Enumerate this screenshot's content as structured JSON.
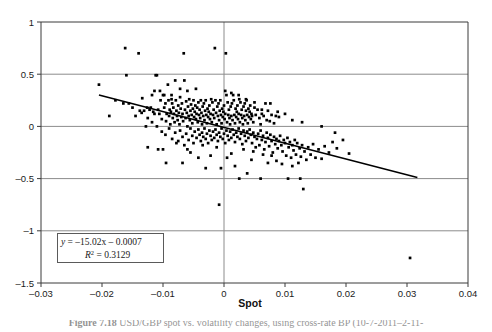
{
  "figure": {
    "name": "scatter-plot-spot-regression",
    "background": "#ffffff",
    "frame_color": "#3a3a3a",
    "grid_color": "#8c8c8c",
    "point_color": "#000000",
    "line_color": "#000000"
  },
  "axis": {
    "x_title": "Spot",
    "y_title": "",
    "x_ticks": [
      "-0.03",
      "-0.02",
      "-0.01",
      "0",
      "0.01",
      "0.02",
      "0.03",
      "0.04"
    ],
    "x_tick_values": [
      -0.03,
      -0.02,
      -0.01,
      0,
      0.01,
      0.02,
      0.03,
      0.04
    ],
    "y_ticks": [
      "1",
      "0.5",
      "0",
      "-0.5",
      "-1",
      "-1.5"
    ],
    "y_tick_values": [
      1,
      0.5,
      0,
      -0.5,
      -1,
      -1.5
    ]
  },
  "annotation": {
    "name": "regression-equation-box",
    "equation_lhs": "y",
    "equation_rhs": " = –15.02x – 0.0007",
    "equation_full": "y = –15.02x – 0.0007",
    "r2_symbol": "R",
    "r2_sup": "2",
    "r2_value": " = 0.3129",
    "r2_full": "R2 = 0.3129"
  },
  "caption": {
    "label": "Figure 7.18",
    "text": "USD/GBP spot vs. volatility changes, using cross-rate BP (10-7-2011–2-11-"
  },
  "chart_data": {
    "type": "scatter",
    "title": "",
    "xlabel": "Spot",
    "ylabel": "",
    "xlim": [
      -0.03,
      0.04
    ],
    "ylim": [
      -1.5,
      1.0
    ],
    "grid": true,
    "legend": false,
    "trendline": {
      "type": "linear",
      "slope": -15.02,
      "intercept": -0.0007,
      "r_squared": 0.3129,
      "x_start": -0.0205,
      "x_end": 0.0317,
      "y_start": 0.3,
      "y_end": -0.49
    },
    "points": [
      [
        -0.0205,
        0.4
      ],
      [
        -0.0188,
        0.1
      ],
      [
        -0.0178,
        0.25
      ],
      [
        -0.0162,
        0.75
      ],
      [
        -0.016,
        0.49
      ],
      [
        -0.0156,
        0.22
      ],
      [
        -0.014,
        0.7
      ],
      [
        -0.0138,
        0.15
      ],
      [
        -0.0131,
        0.15
      ],
      [
        -0.0128,
        0.0
      ],
      [
        -0.0126,
        0.18
      ],
      [
        -0.0122,
        0.16
      ],
      [
        -0.012,
        0.18
      ],
      [
        -0.0118,
        0.3
      ],
      [
        -0.0116,
        0.14
      ],
      [
        -0.0114,
        0.12
      ],
      [
        -0.0112,
        0.49
      ],
      [
        -0.011,
        0.49
      ],
      [
        -0.0108,
        0.16
      ],
      [
        -0.0106,
        0.12
      ],
      [
        -0.0105,
        0.34
      ],
      [
        -0.0104,
        0.25
      ],
      [
        -0.0102,
        0.07
      ],
      [
        -0.01,
        0.3
      ],
      [
        -0.0098,
        0.18
      ],
      [
        -0.0096,
        0.22
      ],
      [
        -0.0095,
        0.05
      ],
      [
        -0.0094,
        0.12
      ],
      [
        -0.0092,
        0.4
      ],
      [
        -0.0091,
        0.25
      ],
      [
        -0.009,
        0.1
      ],
      [
        -0.0089,
        0.16
      ],
      [
        -0.0088,
        0.02
      ],
      [
        -0.0087,
        0.14
      ],
      [
        -0.0086,
        0.3
      ],
      [
        -0.0085,
        0.22
      ],
      [
        -0.0084,
        0.08
      ],
      [
        -0.0083,
        0.18
      ],
      [
        -0.0082,
        0.12
      ],
      [
        -0.0081,
        0.04
      ],
      [
        -0.008,
        0.44
      ],
      [
        -0.0079,
        0.25
      ],
      [
        -0.0078,
        0.15
      ],
      [
        -0.0077,
        0.1
      ],
      [
        -0.0076,
        0.06
      ],
      [
        -0.0075,
        0.2
      ],
      [
        -0.0074,
        0.13
      ],
      [
        -0.0073,
        0.02
      ],
      [
        -0.0072,
        0.28
      ],
      [
        -0.0071,
        0.17
      ],
      [
        -0.007,
        0.09
      ],
      [
        -0.0069,
        0.22
      ],
      [
        -0.0068,
        0.12
      ],
      [
        -0.0067,
        0.05
      ],
      [
        -0.0066,
        0.7
      ],
      [
        -0.0065,
        0.44
      ],
      [
        -0.0064,
        0.16
      ],
      [
        -0.0063,
        0.08
      ],
      [
        -0.0062,
        0.24
      ],
      [
        -0.0061,
        0.13
      ],
      [
        -0.006,
        0.0
      ],
      [
        -0.0059,
        0.19
      ],
      [
        -0.0058,
        0.1
      ],
      [
        -0.0057,
        0.26
      ],
      [
        -0.0056,
        0.06
      ],
      [
        -0.0055,
        0.15
      ],
      [
        -0.0054,
        0.21
      ],
      [
        -0.0053,
        0.11
      ],
      [
        -0.0052,
        0.03
      ],
      [
        -0.0051,
        0.17
      ],
      [
        -0.005,
        0.25
      ],
      [
        -0.0049,
        0.09
      ],
      [
        -0.0048,
        0.14
      ],
      [
        -0.0047,
        0.2
      ],
      [
        -0.0046,
        0.07
      ],
      [
        -0.0045,
        0.12
      ],
      [
        -0.0044,
        0.18
      ],
      [
        -0.0043,
        0.04
      ],
      [
        -0.0042,
        0.23
      ],
      [
        -0.0041,
        0.11
      ],
      [
        -0.004,
        0.16
      ],
      [
        -0.0039,
        0.08
      ],
      [
        -0.0038,
        0.25
      ],
      [
        -0.0037,
        0.13
      ],
      [
        -0.0036,
        0.02
      ],
      [
        -0.0035,
        0.19
      ],
      [
        -0.0034,
        0.1
      ],
      [
        -0.0033,
        0.22
      ],
      [
        -0.0032,
        0.06
      ],
      [
        -0.0031,
        0.15
      ],
      [
        -0.003,
        0.25
      ],
      [
        -0.0029,
        0.11
      ],
      [
        -0.0028,
        0.03
      ],
      [
        -0.0027,
        0.17
      ],
      [
        -0.0026,
        0.09
      ],
      [
        -0.0025,
        0.14
      ],
      [
        -0.0024,
        0.2
      ],
      [
        -0.0023,
        0.07
      ],
      [
        -0.0022,
        0.12
      ],
      [
        -0.0021,
        0.26
      ],
      [
        -0.002,
        0.04
      ],
      [
        -0.0019,
        0.23
      ],
      [
        -0.0018,
        0.11
      ],
      [
        -0.0017,
        0.16
      ],
      [
        -0.0016,
        0.08
      ],
      [
        -0.0015,
        0.75
      ],
      [
        -0.0014,
        0.25
      ],
      [
        -0.0013,
        0.13
      ],
      [
        -0.0012,
        0.02
      ],
      [
        -0.0011,
        0.19
      ],
      [
        -0.001,
        0.1
      ],
      [
        -0.0009,
        0.22
      ],
      [
        -0.0008,
        -0.75
      ],
      [
        -0.0008,
        0.06
      ],
      [
        -0.0007,
        0.15
      ],
      [
        -0.0006,
        0.25
      ],
      [
        -0.0005,
        0.11
      ],
      [
        -0.0004,
        0.03
      ],
      [
        -0.0003,
        0.17
      ],
      [
        -0.0002,
        0.09
      ],
      [
        -0.0001,
        0.14
      ],
      [
        0.0,
        0.2
      ],
      [
        0.0001,
        0.07
      ],
      [
        0.0002,
        0.12
      ],
      [
        0.0003,
        0.7
      ],
      [
        0.0004,
        0.3
      ],
      [
        0.0005,
        0.04
      ],
      [
        0.0006,
        0.23
      ],
      [
        0.0007,
        0.11
      ],
      [
        0.0008,
        0.16
      ],
      [
        0.0009,
        0.08
      ],
      [
        0.001,
        0.02
      ],
      [
        0.0011,
        0.19
      ],
      [
        0.0012,
        0.1
      ],
      [
        0.0013,
        0.22
      ],
      [
        0.0014,
        0.06
      ],
      [
        0.0015,
        0.3
      ],
      [
        0.0016,
        0.25
      ],
      [
        0.0017,
        0.11
      ],
      [
        0.0018,
        0.03
      ],
      [
        0.0019,
        0.17
      ],
      [
        0.002,
        0.09
      ],
      [
        0.0021,
        0.14
      ],
      [
        0.0022,
        0.2
      ],
      [
        0.0023,
        0.07
      ],
      [
        0.0024,
        0.12
      ],
      [
        0.0025,
        0.26
      ],
      [
        0.0026,
        0.04
      ],
      [
        0.0027,
        0.23
      ],
      [
        0.0028,
        0.11
      ],
      [
        0.0029,
        0.16
      ],
      [
        0.003,
        0.08
      ],
      [
        0.0031,
        0.02
      ],
      [
        0.0032,
        0.19
      ],
      [
        0.0033,
        0.1
      ],
      [
        0.0034,
        0.22
      ],
      [
        0.0035,
        0.06
      ],
      [
        0.0036,
        0.15
      ],
      [
        0.0037,
        0.25
      ],
      [
        0.0038,
        0.11
      ],
      [
        0.0039,
        0.03
      ],
      [
        0.004,
        0.17
      ],
      [
        0.0041,
        0.09
      ],
      [
        0.0042,
        0.14
      ],
      [
        0.0043,
        0.2
      ],
      [
        0.0044,
        0.07
      ],
      [
        0.0045,
        0.12
      ],
      [
        0.0046,
        0.1
      ],
      [
        0.0048,
        0.04
      ],
      [
        0.005,
        0.23
      ],
      [
        0.0052,
        0.11
      ],
      [
        0.0055,
        0.16
      ],
      [
        0.0058,
        0.08
      ],
      [
        0.006,
        0.02
      ],
      [
        0.0062,
        0.12
      ],
      [
        0.0065,
        0.1
      ],
      [
        0.0068,
        0.22
      ],
      [
        0.007,
        0.06
      ],
      [
        0.0072,
        0.15
      ],
      [
        0.0075,
        0.05
      ],
      [
        0.0078,
        0.11
      ],
      [
        0.0082,
        0.03
      ],
      [
        0.0085,
        0.1
      ],
      [
        0.009,
        0.09
      ],
      [
        -0.0165,
        0.22
      ],
      [
        -0.015,
        0.18
      ],
      [
        -0.0145,
        0.1
      ],
      [
        -0.0135,
        0.13
      ],
      [
        -0.0125,
        0.08
      ],
      [
        -0.0118,
        0.04
      ],
      [
        -0.011,
        0.0
      ],
      [
        -0.0102,
        -0.05
      ],
      [
        -0.0096,
        -0.08
      ],
      [
        -0.009,
        -0.02
      ],
      [
        -0.0085,
        -0.12
      ],
      [
        -0.008,
        -0.06
      ],
      [
        -0.0075,
        -0.14
      ],
      [
        -0.0072,
        -0.04
      ],
      [
        -0.0068,
        -0.1
      ],
      [
        -0.0065,
        -0.18
      ],
      [
        -0.0062,
        -0.07
      ],
      [
        -0.0058,
        -0.13
      ],
      [
        -0.0055,
        -0.02
      ],
      [
        -0.0052,
        -0.09
      ],
      [
        -0.005,
        -0.16
      ],
      [
        -0.0048,
        -0.05
      ],
      [
        -0.0045,
        -0.11
      ],
      [
        -0.0042,
        -0.03
      ],
      [
        -0.004,
        -0.08
      ],
      [
        -0.0038,
        -0.14
      ],
      [
        -0.0036,
        -0.06
      ],
      [
        -0.0034,
        -0.1
      ],
      [
        -0.0032,
        -0.02
      ],
      [
        -0.003,
        -0.12
      ],
      [
        -0.0028,
        -0.07
      ],
      [
        -0.0026,
        -0.16
      ],
      [
        -0.0024,
        -0.04
      ],
      [
        -0.0022,
        -0.09
      ],
      [
        -0.002,
        -0.13
      ],
      [
        -0.0018,
        -0.05
      ],
      [
        -0.0016,
        -0.11
      ],
      [
        -0.0014,
        -0.03
      ],
      [
        -0.0012,
        -0.08
      ],
      [
        -0.001,
        -0.14
      ],
      [
        -0.0008,
        -0.06
      ],
      [
        -0.0006,
        -0.1
      ],
      [
        -0.0004,
        -0.02
      ],
      [
        -0.0002,
        -0.12
      ],
      [
        0.0,
        -0.07
      ],
      [
        0.0002,
        -0.16
      ],
      [
        0.0004,
        -0.04
      ],
      [
        0.0006,
        -0.09
      ],
      [
        0.0008,
        -0.13
      ],
      [
        0.001,
        -0.05
      ],
      [
        0.0012,
        -0.11
      ],
      [
        0.0014,
        -0.03
      ],
      [
        0.0016,
        -0.08
      ],
      [
        0.0018,
        -0.15
      ],
      [
        0.002,
        -0.06
      ],
      [
        0.0022,
        -0.1
      ],
      [
        0.0024,
        -0.02
      ],
      [
        0.0026,
        -0.12
      ],
      [
        0.0028,
        -0.07
      ],
      [
        0.003,
        -0.17
      ],
      [
        0.0032,
        -0.04
      ],
      [
        0.0034,
        -0.09
      ],
      [
        0.0036,
        -0.14
      ],
      [
        0.0038,
        -0.05
      ],
      [
        0.004,
        -0.11
      ],
      [
        0.0042,
        -0.03
      ],
      [
        0.0044,
        -0.08
      ],
      [
        0.0046,
        -0.16
      ],
      [
        0.0048,
        -0.06
      ],
      [
        0.005,
        -0.1
      ],
      [
        0.0052,
        -0.2
      ],
      [
        0.0054,
        -0.12
      ],
      [
        0.0056,
        -0.07
      ],
      [
        0.0058,
        -0.18
      ],
      [
        0.006,
        -0.04
      ],
      [
        0.0062,
        -0.13
      ],
      [
        0.0064,
        -0.09
      ],
      [
        0.0066,
        -0.22
      ],
      [
        0.0068,
        -0.15
      ],
      [
        0.007,
        -0.06
      ],
      [
        0.0072,
        -0.11
      ],
      [
        0.0074,
        -0.19
      ],
      [
        0.0076,
        -0.08
      ],
      [
        0.0078,
        -0.14
      ],
      [
        0.008,
        -0.25
      ],
      [
        0.0082,
        -0.1
      ],
      [
        0.0084,
        -0.17
      ],
      [
        0.0086,
        -0.12
      ],
      [
        0.0088,
        -0.21
      ],
      [
        0.009,
        -0.14
      ],
      [
        0.0092,
        -0.09
      ],
      [
        0.0094,
        -0.18
      ],
      [
        0.0096,
        -0.24
      ],
      [
        0.0098,
        -0.13
      ],
      [
        0.01,
        -0.16
      ],
      [
        0.0102,
        -0.28
      ],
      [
        0.0104,
        -0.11
      ],
      [
        0.0106,
        -0.2
      ],
      [
        0.0108,
        -0.15
      ],
      [
        0.011,
        -0.3
      ],
      [
        0.0112,
        -0.18
      ],
      [
        0.0114,
        -0.23
      ],
      [
        0.0116,
        -0.13
      ],
      [
        0.0118,
        -0.27
      ],
      [
        0.012,
        -0.16
      ],
      [
        0.0122,
        -0.35
      ],
      [
        0.0124,
        -0.21
      ],
      [
        0.0126,
        -0.29
      ],
      [
        0.0128,
        -0.18
      ],
      [
        0.013,
        -0.6
      ],
      [
        0.0132,
        -0.24
      ],
      [
        0.0135,
        -0.32
      ],
      [
        0.0138,
        -0.2
      ],
      [
        0.0142,
        -0.27
      ],
      [
        0.0146,
        -0.17
      ],
      [
        0.015,
        -0.3
      ],
      [
        0.0155,
        -0.22
      ],
      [
        0.016,
        -0.31
      ],
      [
        0.0165,
        -0.19
      ],
      [
        0.0172,
        -0.25
      ],
      [
        0.0178,
        -0.15
      ],
      [
        0.0185,
        -0.21
      ],
      [
        0.0195,
        -0.13
      ],
      [
        0.0205,
        -0.26
      ],
      [
        0.0305,
        -1.26
      ],
      [
        0.0125,
        -0.5
      ],
      [
        0.0105,
        -0.5
      ],
      [
        0.006,
        -0.5
      ],
      [
        0.0038,
        -0.45
      ],
      [
        0.0025,
        -0.5
      ],
      [
        0.0018,
        -0.38
      ],
      [
        -0.0005,
        -0.4
      ],
      [
        -0.003,
        -0.4
      ],
      [
        -0.0042,
        -0.3
      ],
      [
        -0.0068,
        -0.35
      ],
      [
        -0.0095,
        -0.35
      ],
      [
        -0.01,
        -0.22
      ],
      [
        -0.0108,
        -0.22
      ],
      [
        -0.0125,
        -0.2
      ],
      [
        -0.0055,
        -0.25
      ],
      [
        -0.0022,
        -0.28
      ],
      [
        0.0005,
        -0.3
      ],
      [
        0.0012,
        -0.26
      ],
      [
        0.0045,
        -0.32
      ],
      [
        0.0072,
        -0.35
      ],
      [
        0.0086,
        -0.33
      ],
      [
        0.0095,
        -0.36
      ],
      [
        0.0112,
        -0.38
      ],
      [
        0.0078,
        -0.28
      ],
      [
        0.0064,
        -0.27
      ],
      [
        0.0048,
        -0.24
      ],
      [
        0.0032,
        -0.22
      ],
      [
        -0.0012,
        -0.2
      ],
      [
        -0.0035,
        -0.18
      ],
      [
        -0.006,
        -0.22
      ],
      [
        -0.0078,
        -0.16
      ],
      [
        0.0002,
        0.34
      ],
      [
        0.0012,
        0.32
      ],
      [
        0.0024,
        0.3
      ],
      [
        0.0036,
        0.26
      ],
      [
        0.005,
        0.18
      ],
      [
        0.0062,
        0.16
      ],
      [
        0.0076,
        0.22
      ],
      [
        0.0088,
        0.14
      ],
      [
        0.01,
        0.12
      ],
      [
        0.0112,
        0.06
      ],
      [
        0.0128,
        0.04
      ],
      [
        0.016,
        0.0
      ],
      [
        0.0182,
        -0.06
      ],
      [
        -0.0046,
        0.36
      ],
      [
        -0.006,
        0.34
      ],
      [
        -0.0072,
        0.36
      ],
      [
        -0.0086,
        0.26
      ],
      [
        -0.0114,
        0.34
      ],
      [
        -0.0098,
        0.3
      ],
      [
        -0.0134,
        0.27
      ]
    ]
  }
}
